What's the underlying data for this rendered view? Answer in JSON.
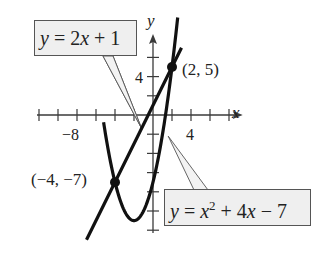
{
  "chart_data": {
    "type": "line",
    "title": "",
    "xlabel": "x",
    "ylabel": "y",
    "xlim": [
      -13,
      9
    ],
    "ylim": [
      -12,
      8
    ],
    "x_tick_step": 2,
    "y_tick_step": 2,
    "x_tick_labels": [
      {
        "value": -8,
        "label": "−8"
      },
      {
        "value": 4,
        "label": "4"
      }
    ],
    "y_tick_labels": [
      {
        "value": 4,
        "label": "4"
      }
    ],
    "grid": false,
    "series": [
      {
        "name": "y = 2x + 1",
        "kind": "linear",
        "a": 0,
        "b": 2,
        "c": 1,
        "x_range": [
          -7,
          3
        ]
      },
      {
        "name": "y = x² + 4x − 7",
        "kind": "quadratic",
        "a": 1,
        "b": 4,
        "c": -7,
        "x_range": [
          -5.2,
          2.6
        ]
      }
    ],
    "points": [
      {
        "x": 2,
        "y": 5,
        "label": "(2, 5)"
      },
      {
        "x": -4,
        "y": -7,
        "label": "(−4, −7)"
      }
    ],
    "annotations": [
      {
        "text": "y = 2x + 1",
        "target": "line"
      },
      {
        "text": "y = x² + 4x − 7",
        "target": "parabola"
      }
    ]
  },
  "labels": {
    "x_axis": "x",
    "y_axis": "y",
    "tick_x_neg8": "−8",
    "tick_x_4": "4",
    "tick_y_4": "4",
    "point_a": "(2, 5)",
    "point_b": "(−4, −7)",
    "line_eq": {
      "y": "y",
      "rest": " = 2",
      "x": "x",
      "tail": " + 1"
    },
    "parabola_eq": {
      "y": "y",
      "eq": " = ",
      "x": "x",
      "sup": "2",
      "mid": " + 4",
      "x2": "x",
      "tail": " − 7"
    }
  }
}
